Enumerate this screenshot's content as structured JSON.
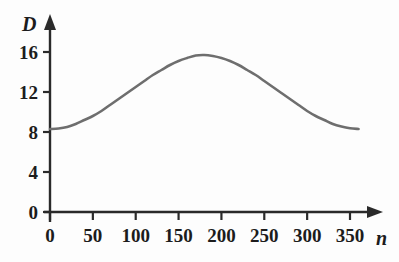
{
  "chart_data": {
    "type": "line",
    "title": "",
    "xlabel": "n",
    "ylabel": "D",
    "xlim": [
      0,
      375
    ],
    "ylim": [
      0,
      18
    ],
    "grid": false,
    "legend": null,
    "axis_style": "arrow-ended axes, ticks outward, no gridlines",
    "series": [
      {
        "name": "D",
        "color": "#6e6e6e",
        "line_width": 2.6,
        "description": "smooth sinusoidal curve, minimum near n=0 and n=360, maximum near n=170",
        "x": [
          0,
          10,
          20,
          30,
          40,
          50,
          60,
          70,
          80,
          90,
          100,
          110,
          120,
          130,
          140,
          150,
          160,
          170,
          180,
          190,
          200,
          210,
          220,
          230,
          240,
          250,
          260,
          270,
          280,
          290,
          300,
          310,
          320,
          330,
          340,
          350,
          360
        ],
        "values": [
          8.3,
          8.35,
          8.5,
          8.8,
          9.2,
          9.6,
          10.1,
          10.7,
          11.3,
          11.9,
          12.5,
          13.1,
          13.7,
          14.2,
          14.7,
          15.1,
          15.4,
          15.65,
          15.7,
          15.6,
          15.4,
          15.1,
          14.7,
          14.2,
          13.7,
          13.1,
          12.5,
          11.9,
          11.3,
          10.7,
          10.1,
          9.6,
          9.2,
          8.8,
          8.55,
          8.38,
          8.3
        ]
      }
    ],
    "x_ticks": [
      {
        "value": 0,
        "label": "0"
      },
      {
        "value": 50,
        "label": "50"
      },
      {
        "value": 100,
        "label": "100"
      },
      {
        "value": 150,
        "label": "150"
      },
      {
        "value": 200,
        "label": "200"
      },
      {
        "value": 250,
        "label": "250"
      },
      {
        "value": 300,
        "label": "300"
      },
      {
        "value": 350,
        "label": "350"
      }
    ],
    "y_ticks": [
      {
        "value": 0,
        "label": "0"
      },
      {
        "value": 4,
        "label": "4"
      },
      {
        "value": 8,
        "label": "8"
      },
      {
        "value": 12,
        "label": "12"
      },
      {
        "value": 16,
        "label": "16"
      }
    ],
    "colors": {
      "curve": "#6e6e6e",
      "axis": "#2a2a2a",
      "text": "#1c1c1c",
      "background": "#fdfdfd"
    }
  }
}
